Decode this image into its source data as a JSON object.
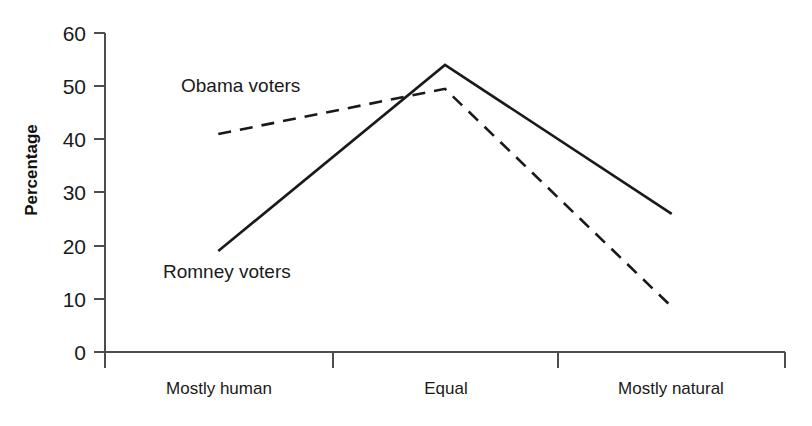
{
  "chart_data": {
    "type": "line",
    "title": "",
    "xlabel": "",
    "ylabel": "Percentage",
    "categories": [
      "Mostly human",
      "Equal",
      "Mostly natural"
    ],
    "ylim": [
      0,
      60
    ],
    "yticks": [
      0,
      10,
      20,
      30,
      40,
      50,
      60
    ],
    "grid": false,
    "legend_position": "inline-annotation",
    "series": [
      {
        "name": "Obama voters",
        "style": "dashed",
        "color": "#1a1a1a",
        "values": [
          41,
          49.5,
          8.5
        ]
      },
      {
        "name": "Romney voters",
        "style": "solid",
        "color": "#1a1a1a",
        "values": [
          19,
          54,
          26
        ]
      }
    ],
    "annotations": [
      {
        "text": "Obama voters",
        "series": "Obama voters"
      },
      {
        "text": "Romney voters",
        "series": "Romney voters"
      }
    ]
  },
  "axis": {
    "y_tick_labels": [
      "60",
      "50",
      "40",
      "30",
      "20",
      "10",
      "0"
    ],
    "y_title": "Percentage",
    "x_tick_labels": [
      "Mostly human",
      "Equal",
      "Mostly natural"
    ]
  },
  "colors": {
    "axis": "#4d4d4d",
    "line": "#1a1a1a",
    "text": "#1a1a1a",
    "background": "#ffffff"
  }
}
